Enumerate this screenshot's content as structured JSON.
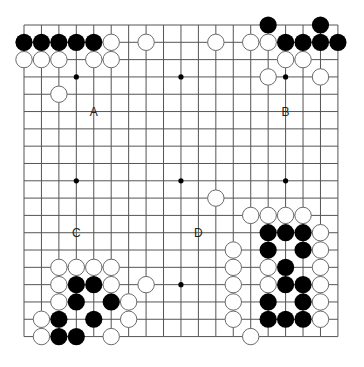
{
  "board": {
    "size": 19,
    "origin_x": 24,
    "origin_y": 25,
    "spacing_x": 17.44,
    "spacing_y": 17.31,
    "stone_radius": 8.6,
    "line_color": "#555555",
    "black_color": "#000000",
    "white_fill": "#ffffff",
    "white_stroke": "#6a6a6a",
    "star_points": [
      [
        3,
        3
      ],
      [
        9,
        3
      ],
      [
        15,
        3
      ],
      [
        3,
        9
      ],
      [
        9,
        9
      ],
      [
        15,
        9
      ],
      [
        3,
        15
      ],
      [
        9,
        15
      ],
      [
        15,
        15
      ]
    ]
  },
  "stones": {
    "black": [
      [
        0,
        1
      ],
      [
        1,
        1
      ],
      [
        2,
        1
      ],
      [
        3,
        1
      ],
      [
        4,
        1
      ],
      [
        14,
        0
      ],
      [
        17,
        0
      ],
      [
        15,
        1
      ],
      [
        16,
        1
      ],
      [
        17,
        1
      ],
      [
        18,
        1
      ],
      [
        3,
        15
      ],
      [
        4,
        15
      ],
      [
        3,
        16
      ],
      [
        5,
        16
      ],
      [
        2,
        17
      ],
      [
        4,
        17
      ],
      [
        2,
        18
      ],
      [
        3,
        18
      ],
      [
        14,
        12
      ],
      [
        15,
        12
      ],
      [
        16,
        12
      ],
      [
        14,
        13
      ],
      [
        16,
        13
      ],
      [
        15,
        14
      ],
      [
        15,
        15
      ],
      [
        16,
        15
      ],
      [
        14,
        16
      ],
      [
        16,
        16
      ],
      [
        14,
        17
      ],
      [
        15,
        17
      ],
      [
        16,
        17
      ]
    ],
    "white": [
      [
        5,
        1
      ],
      [
        7,
        1
      ],
      [
        0,
        2
      ],
      [
        1,
        2
      ],
      [
        2,
        2
      ],
      [
        4,
        2
      ],
      [
        5,
        2
      ],
      [
        2,
        4
      ],
      [
        11,
        1
      ],
      [
        13,
        1
      ],
      [
        14,
        1
      ],
      [
        15,
        2
      ],
      [
        16,
        2
      ],
      [
        14,
        3
      ],
      [
        17,
        3
      ],
      [
        11,
        10
      ],
      [
        2,
        14
      ],
      [
        3,
        14
      ],
      [
        4,
        14
      ],
      [
        5,
        14
      ],
      [
        2,
        15
      ],
      [
        5,
        15
      ],
      [
        7,
        15
      ],
      [
        2,
        16
      ],
      [
        6,
        16
      ],
      [
        1,
        17
      ],
      [
        6,
        17
      ],
      [
        1,
        18
      ],
      [
        5,
        18
      ],
      [
        13,
        11
      ],
      [
        14,
        11
      ],
      [
        15,
        11
      ],
      [
        16,
        11
      ],
      [
        17,
        12
      ],
      [
        12,
        13
      ],
      [
        17,
        13
      ],
      [
        12,
        14
      ],
      [
        14,
        14
      ],
      [
        17,
        14
      ],
      [
        12,
        15
      ],
      [
        14,
        15
      ],
      [
        17,
        15
      ],
      [
        12,
        16
      ],
      [
        17,
        16
      ],
      [
        12,
        17
      ],
      [
        17,
        17
      ],
      [
        13,
        18
      ]
    ]
  },
  "labels": [
    {
      "text": "A",
      "col": 4,
      "row": 5
    },
    {
      "text": "B",
      "col": 15,
      "row": 5
    },
    {
      "text": "C",
      "col": 3,
      "row": 12
    },
    {
      "text": "D",
      "col": 10,
      "row": 12
    }
  ]
}
